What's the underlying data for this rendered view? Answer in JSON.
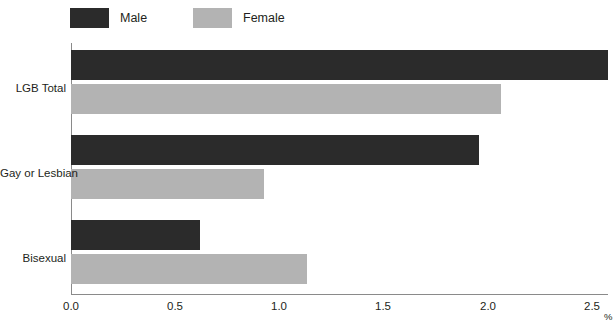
{
  "legend": {
    "items": [
      {
        "label": "Male",
        "color": "#2b2b2b",
        "swatch_name": "legend-swatch-male"
      },
      {
        "label": "Female",
        "color": "#b3b3b3",
        "swatch_name": "legend-swatch-female"
      }
    ]
  },
  "axis": {
    "x_ticks": [
      "0.0",
      "0.5",
      "1.0",
      "1.5",
      "2.0",
      "2.5"
    ],
    "x_unit": "%",
    "y_categories": [
      "LGB Total",
      "Gay or Lesbian",
      "Bisexual"
    ]
  },
  "footnote": {
    "text": ""
  },
  "chart_data": {
    "type": "bar",
    "orientation": "horizontal",
    "title": "",
    "subtitle": "",
    "xlabel": "%",
    "ylabel": "",
    "categories": [
      "LGB Total",
      "Gay or Lesbian",
      "Bisexual"
    ],
    "series": [
      {
        "name": "Male",
        "color": "#2b2b2b",
        "values": [
          2.5,
          1.9,
          0.6
        ]
      },
      {
        "name": "Female",
        "color": "#b3b3b3",
        "values": [
          2.0,
          0.9,
          1.1
        ]
      }
    ],
    "xlim": [
      0.0,
      2.5
    ],
    "xticks": [
      0.0,
      0.5,
      1.0,
      1.5,
      2.0,
      2.5
    ],
    "xtick_labels": [
      "0.0",
      "0.5",
      "1.0",
      "1.5",
      "2.0",
      "2.5"
    ],
    "grid": false,
    "legend_position": "top-left"
  }
}
